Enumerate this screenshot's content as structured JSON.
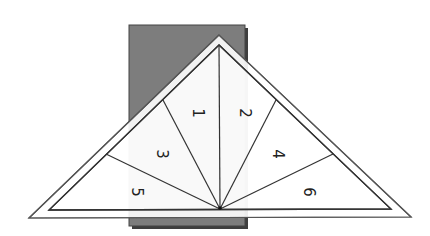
{
  "diagram": {
    "type": "foundation-paper-piecing-template",
    "colors": {
      "background": "#ffffff",
      "paper_fill": "#7a7a7a",
      "paper_shadow": "#4a4a4a",
      "overlay_fill": "#f2f2f2",
      "line": "#333333"
    },
    "sections": [
      {
        "id": "1",
        "label": "1",
        "x": 197,
        "y": 113
      },
      {
        "id": "2",
        "label": "2",
        "x": 244,
        "y": 113
      },
      {
        "id": "3",
        "label": "3",
        "x": 161,
        "y": 154
      },
      {
        "id": "4",
        "label": "4",
        "x": 277,
        "y": 154
      },
      {
        "id": "5",
        "label": "5",
        "x": 136,
        "y": 192
      },
      {
        "id": "6",
        "label": "6",
        "x": 308,
        "y": 192
      }
    ]
  }
}
